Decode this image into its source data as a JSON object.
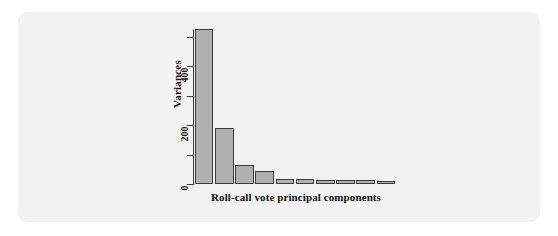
{
  "chart_data": {
    "type": "bar",
    "title": "",
    "subtitle": "",
    "xlabel": "Roll-call vote principal components",
    "ylabel": "Variances",
    "categories": [
      "PC1",
      "PC2",
      "PC3",
      "PC4",
      "PC5",
      "PC6",
      "PC7",
      "PC8",
      "PC9",
      "PC10"
    ],
    "values": [
      525,
      190,
      65,
      45,
      18,
      17,
      15,
      13,
      12,
      11
    ],
    "ylim": [
      0,
      560
    ],
    "y_ticks_major": [
      0,
      200,
      400
    ],
    "y_tick_labels": [
      "0",
      "200",
      "400"
    ],
    "y_ticks_minor": [
      100,
      300,
      500
    ],
    "grid": false,
    "legend": "none",
    "bar_fill_color": "#b0b0b0",
    "bar_border_color": "#3a3a3a",
    "axis_color": "#3b3b3b",
    "panel_background": "#f2f2f2",
    "page_background": "#ffffff"
  },
  "figure": {
    "y_axis_title": "Variances",
    "x_axis_title": "Roll-call vote principal components",
    "tick_labels": {
      "t0": "0",
      "t200": "200",
      "t400": "400"
    }
  }
}
